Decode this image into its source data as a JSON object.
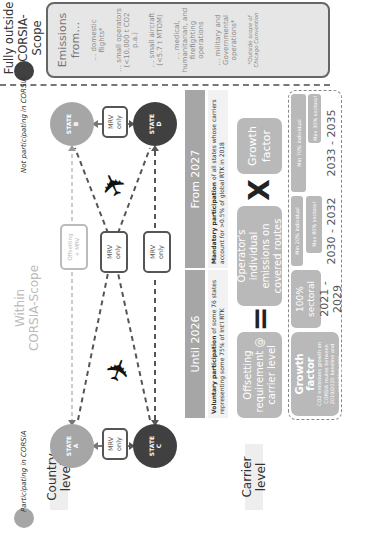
{
  "legend": {
    "participating": "Participating in CORSIA",
    "not_participating": "Not participating in CORSIA",
    "participating_color": "#a6a6a6",
    "not_participating_color": "#404040"
  },
  "scope": {
    "within_line1": "Within",
    "within_line2": "CORSIA-Scope",
    "outside_line1": "Fully outside",
    "outside_line2": "CORSIA-Scope"
  },
  "row_labels": {
    "country": "Country level",
    "carrier": "Carrier level"
  },
  "states": {
    "a": {
      "line1": "STATE",
      "line2": "A"
    },
    "b": {
      "line1": "STATE",
      "line2": "B"
    },
    "c": {
      "line1": "STATE",
      "line2": "C"
    },
    "d": {
      "line1": "STATE",
      "line2": "D"
    }
  },
  "routes": {
    "ac": {
      "line1": "MRV",
      "line2": "only"
    },
    "bd": {
      "line1": "MRV",
      "line2": "only"
    },
    "ab": {
      "line1": "Offsetting",
      "line2": "+ MRV"
    },
    "cross": {
      "line1": "MRV",
      "line2": "only"
    },
    "cd": {
      "line1": "MRV",
      "line2": "only"
    }
  },
  "phases": {
    "until": {
      "header": "Until 2026",
      "desc_bold": "Voluntary participation",
      "desc_rest": " of some 76 states representing some 75% of Int'l RTK"
    },
    "from": {
      "header": "From 2027",
      "desc_bold": "Mandatory participation",
      "desc_rest": " of all states whose carriers account for >0.5% of global RTK in 2018"
    }
  },
  "formula": {
    "offsetting": "Offsetting requirement @ carrier level",
    "equals": "=",
    "operator": "Operator's individual emissions on covered routes",
    "times": "X",
    "growth": "Growth factor"
  },
  "growth_detail": {
    "title": "Growth factor",
    "desc": "CO2 emissions growth on CORSIA routes between 2019/2020 baseline and reporting year",
    "periods": [
      {
        "years": "2021 - 2029",
        "items": [
          "100% sectoral"
        ]
      },
      {
        "years": "2030 - 2032",
        "items": [
          "Min 20% individual",
          "Max 80% sectoral"
        ]
      },
      {
        "years": "2033 - 2035",
        "items": [
          "Min 70% individual",
          "Max 30% sectoral"
        ]
      }
    ]
  },
  "outside_box": {
    "title": "Emissions from…",
    "items": [
      "… domestic flights*",
      "… small operators (<10,000 t CO2 p.a.)",
      "… small aircraft (<5.7 t MTOM)",
      "… medical, humanitarian, and firefighting operations",
      "… military and Governmental operations*"
    ],
    "footnote": "*Outside scope of Chicago Convention"
  },
  "icons": {
    "plane": "airplane-icon",
    "arrow": "arrow-icon"
  }
}
